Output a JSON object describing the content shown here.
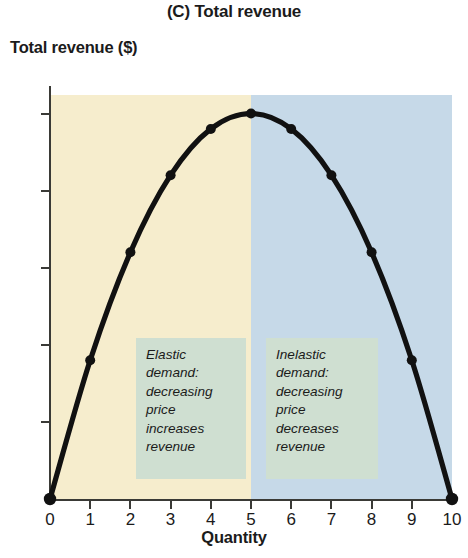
{
  "chart_data": {
    "type": "line",
    "title": "(C) Total revenue",
    "xlabel": "Quantity",
    "ylabel": "Total revenue ($)",
    "x": [
      0,
      1,
      2,
      3,
      4,
      5,
      6,
      7,
      8,
      9,
      10
    ],
    "values": [
      0,
      45,
      80,
      105,
      120,
      125,
      120,
      105,
      80,
      45,
      0
    ],
    "series": [
      {
        "name": "Total revenue",
        "values": [
          0,
          45,
          80,
          105,
          120,
          125,
          120,
          105,
          80,
          45,
          0
        ]
      }
    ],
    "xlim": [
      0,
      10
    ],
    "ylim": [
      0,
      131
    ],
    "x_ticks": [
      0,
      1,
      2,
      3,
      4,
      5,
      6,
      7,
      8,
      9,
      10
    ],
    "x_tick_labels": [
      "0",
      "1",
      "2",
      "3",
      "4",
      "5",
      "6",
      "7",
      "8",
      "9",
      "10"
    ],
    "y_ticks": [
      0,
      25,
      50,
      75,
      100,
      125
    ],
    "y_tick_labels": [
      "0",
      "25",
      "50",
      "75",
      "100",
      "125"
    ],
    "grid": false,
    "legend": false,
    "markers": true,
    "line_color": "#111111",
    "regions": [
      {
        "name": "elastic",
        "x_start": 0,
        "x_end": 5,
        "color": "#f6edcd"
      },
      {
        "name": "inelastic",
        "x_start": 5,
        "x_end": 10,
        "color": "#c6d9e8"
      }
    ],
    "annotations": [
      {
        "name": "elastic",
        "text": "Elastic\ndemand:\ndecreasing\nprice\nincreases\nrevenue",
        "box_color": "#cfdfd1"
      },
      {
        "name": "inelastic",
        "text": "Inelastic\ndemand:\ndecreasing\nprice\ndecreases\nrevenue",
        "box_color": "#cfdfd1"
      }
    ]
  },
  "axis": {
    "y_labels": [
      "125",
      "100",
      "75",
      "50",
      "25",
      "0"
    ],
    "x_labels": [
      "0",
      "1",
      "2",
      "3",
      "4",
      "5",
      "6",
      "7",
      "8",
      "9",
      "10"
    ]
  }
}
